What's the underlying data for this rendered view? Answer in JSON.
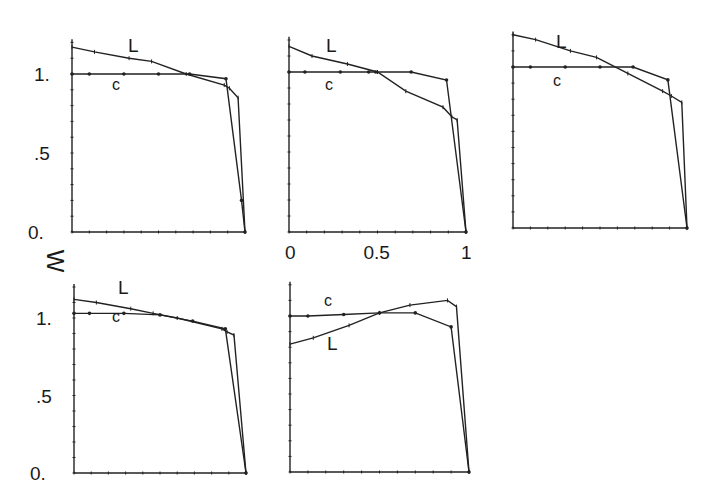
{
  "chart_data": {
    "type": "line",
    "ylabel": "W",
    "xlabel": "",
    "grid": false,
    "legend": "inline labels L and C on each panel",
    "shared_y_ticks": [
      "0.",
      ".5",
      "1."
    ],
    "shared_x_ticks": [
      "0",
      "0.5",
      "1"
    ],
    "xlim": [
      0,
      1
    ],
    "ylim": [
      0,
      1.2
    ],
    "panels": [
      {
        "id": 1,
        "series": [
          {
            "name": "L",
            "x": [
              0,
              0.13,
              0.33,
              0.46,
              0.66,
              0.88,
              0.91,
              0.96,
              1.0
            ],
            "y": [
              1.17,
              1.14,
              1.1,
              1.08,
              1.0,
              0.93,
              0.91,
              0.85,
              0.0
            ]
          },
          {
            "name": "C",
            "x": [
              0,
              0.1,
              0.3,
              0.5,
              0.68,
              0.89,
              0.98,
              1.0
            ],
            "y": [
              1.0,
              1.0,
              1.0,
              1.0,
              1.0,
              0.97,
              0.2,
              0.0
            ]
          }
        ]
      },
      {
        "id": 2,
        "series": [
          {
            "name": "L",
            "x": [
              0,
              0.13,
              0.33,
              0.5,
              0.66,
              0.87,
              0.92,
              0.95,
              1.0
            ],
            "y": [
              1.16,
              1.1,
              1.05,
              1.0,
              0.88,
              0.78,
              0.72,
              0.7,
              0.0
            ]
          },
          {
            "name": "C",
            "x": [
              0,
              0.09,
              0.29,
              0.45,
              0.49,
              0.69,
              0.89,
              1.0
            ],
            "y": [
              1.0,
              1.0,
              1.0,
              1.0,
              1.0,
              1.0,
              0.95,
              0.0
            ]
          }
        ]
      },
      {
        "id": 3,
        "series": [
          {
            "name": "L",
            "x": [
              0,
              0.13,
              0.33,
              0.48,
              0.66,
              0.86,
              0.91,
              0.97,
              1.0
            ],
            "y": [
              1.2,
              1.17,
              1.1,
              1.06,
              0.96,
              0.85,
              0.82,
              0.78,
              0.0
            ]
          },
          {
            "name": "C",
            "x": [
              0,
              0.1,
              0.3,
              0.5,
              0.69,
              0.89,
              1.0
            ],
            "y": [
              1.0,
              1.0,
              1.0,
              1.0,
              1.0,
              0.92,
              0.0
            ]
          }
        ]
      },
      {
        "id": 4,
        "series": [
          {
            "name": "L",
            "x": [
              0,
              0.13,
              0.33,
              0.46,
              0.6,
              0.86,
              0.89,
              0.93,
              1.0
            ],
            "y": [
              1.12,
              1.1,
              1.06,
              1.03,
              1.0,
              0.93,
              0.91,
              0.89,
              0.0
            ]
          },
          {
            "name": "C",
            "x": [
              0,
              0.09,
              0.29,
              0.5,
              0.69,
              0.88,
              1.0
            ],
            "y": [
              1.03,
              1.03,
              1.03,
              1.02,
              0.98,
              0.93,
              0.0
            ]
          }
        ]
      },
      {
        "id": 5,
        "series": [
          {
            "name": "L",
            "x": [
              0,
              0.13,
              0.33,
              0.5,
              0.67,
              0.88,
              0.93,
              1.0
            ],
            "y": [
              0.82,
              0.86,
              0.94,
              1.02,
              1.07,
              1.1,
              1.06,
              0.0
            ]
          },
          {
            "name": "C",
            "x": [
              0,
              0.1,
              0.3,
              0.5,
              0.7,
              0.9,
              1.0
            ],
            "y": [
              1.0,
              1.0,
              1.01,
              1.02,
              1.02,
              0.93,
              0.0
            ]
          }
        ]
      }
    ]
  },
  "labels": {
    "ylabel": "W",
    "y_tick_0": "0.",
    "y_tick_05": ".5",
    "y_tick_1": "1.",
    "x_tick_0": "0",
    "x_tick_05": "0.5",
    "x_tick_1": "1",
    "series_L": "L",
    "series_C": "C"
  }
}
